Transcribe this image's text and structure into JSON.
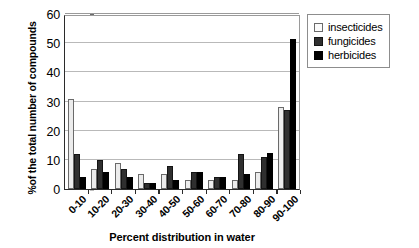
{
  "chart_data": {
    "type": "bar",
    "title": "",
    "xlabel": "Percent distribution in water",
    "ylabel": "%of the total number of compounds",
    "categories": [
      "0-10",
      "10-20",
      "20-30",
      "30-40",
      "40-50",
      "50-60",
      "60-70",
      "70-80",
      "80-90",
      "90-100"
    ],
    "series": [
      {
        "name": "insecticides",
        "color": "#ececec",
        "values": [
          31,
          7,
          9,
          5,
          5,
          3,
          3,
          3,
          6,
          28
        ]
      },
      {
        "name": "fungicides",
        "color": "#2f2f2f",
        "values": [
          12,
          10,
          7,
          2,
          8,
          6,
          4,
          12,
          11,
          27
        ]
      },
      {
        "name": "herbicides",
        "color": "#000000",
        "values": [
          4,
          6,
          4,
          2,
          3,
          6,
          4,
          5,
          12.5,
          51.5
        ]
      }
    ],
    "ylim": [
      0,
      60
    ],
    "yticks": [
      0,
      10,
      20,
      30,
      40,
      50,
      60
    ],
    "ytick_labels": [
      "0",
      "10",
      "20",
      "30",
      "40",
      "50",
      "60"
    ],
    "grid": true,
    "legend_position": "top-right"
  }
}
